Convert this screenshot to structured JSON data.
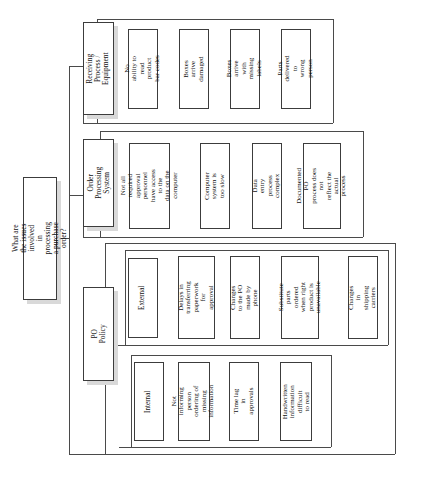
{
  "diagram": {
    "type": "tree-diagram",
    "orientation": "rotated-90-ccw",
    "colors": {
      "box_fill": "#ffffff",
      "box_border": "#3c3c3c",
      "shadow": "#d9d9d9",
      "connector": "#4a4a4a",
      "background": "#ffffff",
      "text": "#111111"
    },
    "root": {
      "label": "What are the issues involved in\nprocessing a purchase order?"
    },
    "branches": [
      {
        "id": "receiving-process-equipment",
        "label": "Receiving Process /\nEquipment",
        "leaves": [
          {
            "label": "No ability to read\nproduct bar codes"
          },
          {
            "label": "Boxes arrive\ndamaged"
          },
          {
            "label": "Boxes arrive with\nmissing labels"
          },
          {
            "label": "Parts delivered to\nwrong person"
          }
        ]
      },
      {
        "id": "order-processing-system",
        "label": "Order Processing\nSystem",
        "leaves": [
          {
            "label": "Not all required\napproval personnel\nhave access to the\ndata on the\ncomputer"
          },
          {
            "label": "Computer system is\ntoo slow"
          },
          {
            "label": "Data entry process\ncomplex"
          },
          {
            "label": "Documented PO\nprocess does not\nreflect the actual\nprocess"
          }
        ]
      },
      {
        "id": "po-policy",
        "label": "PO Policy",
        "subgroups": [
          {
            "id": "external",
            "label": "External",
            "leaves": [
              {
                "label": "Delays in\ntransferring\npaperwork for\napproval"
              },
              {
                "label": "Changes to the PO\nmade by phone"
              },
              {
                "label": "Substitute parts\nordered when right\nproduct is\nunavailable"
              },
              {
                "label": "Changes in shipping\ncarriers"
              }
            ]
          },
          {
            "id": "internal",
            "label": "Internal",
            "leaves": [
              {
                "label": "Not informing\nperson ordering  of\nmissing information"
              },
              {
                "label": "Time lag in\napprovals"
              },
              {
                "label": "Handwritten\ninformation difficult\nto read"
              }
            ]
          }
        ]
      }
    ]
  }
}
